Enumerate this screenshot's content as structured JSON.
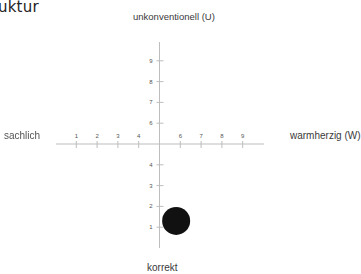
{
  "page": {
    "title_fragment": "uktur"
  },
  "axes": {
    "top_label": "unkonventionell (U)",
    "bottom_label": "korrekt",
    "left_label": "sachlich",
    "right_label": "warmherzig (W)"
  },
  "colors": {
    "axis": "#bdbdbd",
    "tick_label": "#555555",
    "marker": "#111111"
  },
  "chart_data": {
    "type": "scatter",
    "title": "",
    "xlabel_left": "sachlich",
    "xlabel_right": "warmherzig (W)",
    "ylabel_top": "unkonventionell (U)",
    "ylabel_bottom": "korrekt",
    "x_ticks": [
      "1",
      "2",
      "3",
      "4",
      "6",
      "7",
      "8",
      "9"
    ],
    "y_ticks": [
      "1",
      "2",
      "3",
      "4",
      "6",
      "7",
      "8",
      "9"
    ],
    "xlim": [
      0,
      10
    ],
    "ylim": [
      0,
      10
    ],
    "axis_cross": [
      5,
      5
    ],
    "grid": false,
    "legend": null,
    "points": [
      {
        "x": 5.8,
        "y": 1.3,
        "size": "large"
      }
    ]
  }
}
